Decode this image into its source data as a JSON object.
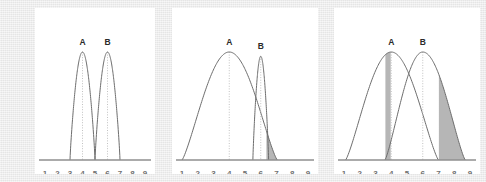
{
  "figure": {
    "background_color": "#e9e9e9",
    "panel_background": "#ffffff",
    "curve_color": "#6d6d6d",
    "shade_color": "#b6b6b6",
    "axis_color": "#8f8f8f"
  },
  "axis": {
    "tick_labels": [
      "1",
      "2",
      "3",
      "4",
      "5",
      "6",
      "7",
      "8",
      "9"
    ],
    "min": 1,
    "max": 9
  },
  "chart_data": {
    "type": "line",
    "title": "",
    "xlabel": "",
    "ylabel": "",
    "xlim": [
      1,
      9
    ],
    "ylim": [
      0,
      1
    ],
    "grid": false,
    "legend": "none",
    "panels": [
      {
        "name": "panel-1",
        "annotations": [
          "A",
          "B"
        ],
        "shaded_regions": [],
        "series": [
          {
            "name": "A",
            "label": "A",
            "peak_x": 4,
            "peak_y": 1.0,
            "left_x": 3.0,
            "right_x": 5.0,
            "width": 2.0,
            "shape": "narrow-peak",
            "label_x": 4,
            "label_y": 1.0
          },
          {
            "name": "B",
            "label": "B",
            "peak_x": 6,
            "peak_y": 1.0,
            "left_x": 5.0,
            "right_x": 7.0,
            "width": 2.0,
            "shape": "narrow-peak",
            "label_x": 6,
            "label_y": 1.0
          }
        ]
      },
      {
        "name": "panel-2",
        "annotations": [
          "A",
          "B"
        ],
        "shaded_regions": [
          {
            "name": "overlap-tail-right",
            "from_x": 6.35,
            "to_x": 7.05,
            "color": "#b6b6b6"
          }
        ],
        "series": [
          {
            "name": "A",
            "label": "A",
            "peak_x": 4,
            "peak_y": 1.0,
            "left_x": 1.0,
            "right_x": 7.05,
            "width": 6.05,
            "shape": "broad-dome",
            "label_x": 4,
            "label_y": 1.0
          },
          {
            "name": "B",
            "label": "B",
            "peak_x": 6,
            "peak_y": 0.96,
            "left_x": 5.5,
            "right_x": 6.5,
            "width": 1.0,
            "shape": "narrow-peak",
            "label_x": 6,
            "label_y": 0.96
          }
        ]
      },
      {
        "name": "panel-3",
        "annotations": [
          "A",
          "B"
        ],
        "shaded_regions": [
          {
            "name": "overlap-tail-left",
            "from_x": 3.6,
            "to_x": 4.0,
            "color": "#b6b6b6"
          },
          {
            "name": "overlap-tail-right",
            "from_x": 7.0,
            "to_x": 8.7,
            "color": "#b6b6b6"
          }
        ],
        "series": [
          {
            "name": "A",
            "label": "A",
            "peak_x": 4,
            "peak_y": 1.0,
            "left_x": 1.1,
            "right_x": 7.0,
            "width": 5.9,
            "shape": "broad-dome",
            "label_x": 4,
            "label_y": 1.0
          },
          {
            "name": "B",
            "label": "B",
            "peak_x": 6,
            "peak_y": 1.0,
            "left_x": 3.6,
            "right_x": 8.7,
            "width": 5.1,
            "shape": "broad-dome",
            "label_x": 6,
            "label_y": 1.0
          }
        ]
      }
    ]
  }
}
